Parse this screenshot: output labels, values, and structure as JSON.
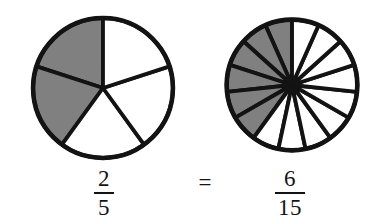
{
  "figure": {
    "equals_symbol": "=",
    "background_color": "#ffffff",
    "outline_color": "#131313",
    "shaded_color": "#808080",
    "unshaded_color": "#ffffff"
  },
  "left": {
    "fraction": {
      "numerator": "2",
      "denominator": "5"
    },
    "total_sectors": 5,
    "shaded_sectors": 2,
    "center": {
      "x": 103,
      "y": 88
    },
    "radius": 75
  },
  "right": {
    "fraction": {
      "numerator": "6",
      "denominator": "15"
    },
    "total_sectors": 15,
    "shaded_sectors": 6,
    "center": {
      "x": 292,
      "y": 85
    },
    "radius": 70
  },
  "chart_data": {
    "type": "pie",
    "title": "2/5 = 6/15",
    "xlabel": "",
    "ylabel": "",
    "legend_position": "none",
    "grid": false,
    "charts": [
      {
        "name": "two-fifths-pie",
        "label": "2/5",
        "categories": [
          "shaded",
          "unshaded"
        ],
        "values": [
          2,
          5
        ],
        "slice_count": 5,
        "slice_value_each": 1,
        "shaded_slice_indices": [
          0,
          1
        ],
        "shaded_fraction": 0.4,
        "start_angle_deg": 90,
        "direction": "counterclockwise"
      },
      {
        "name": "six-fifteenths-pie",
        "label": "6/15",
        "categories": [
          "shaded",
          "unshaded"
        ],
        "values": [
          6,
          15
        ],
        "slice_count": 15,
        "slice_value_each": 1,
        "shaded_slice_indices": [
          0,
          1,
          2,
          3,
          4,
          5
        ],
        "shaded_fraction": 0.4,
        "start_angle_deg": 90,
        "direction": "counterclockwise"
      }
    ]
  }
}
